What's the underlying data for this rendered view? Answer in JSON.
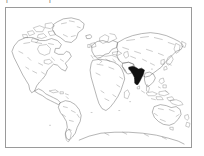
{
  "figure": {
    "type": "world-map",
    "background_color": "#ffffff",
    "frame": {
      "border_color": "#9a9a9a",
      "border_width_px": 1,
      "x": 5,
      "y": 7,
      "width": 187,
      "height": 141
    },
    "projection_note": "equirectangular world outline"
  },
  "cropped_caption": {
    "fragment_1": "|",
    "fragment_2": "|"
  },
  "legend": {
    "highlight_color": "#111111",
    "coastline_color": "#6b6b6b",
    "ocean_color": "#ffffff"
  },
  "regions": [
    {
      "name": "North America",
      "highlighted": false,
      "fill": "#ffffff"
    },
    {
      "name": "Greenland",
      "highlighted": false,
      "fill": "#ffffff"
    },
    {
      "name": "South America",
      "highlighted": false,
      "fill": "#ffffff"
    },
    {
      "name": "Europe",
      "highlighted": false,
      "fill": "#ffffff"
    },
    {
      "name": "Africa",
      "highlighted": false,
      "fill": "#ffffff"
    },
    {
      "name": "Asia",
      "highlighted": false,
      "fill": "#ffffff"
    },
    {
      "name": "India",
      "highlighted": true,
      "fill": "#111111"
    },
    {
      "name": "Sri Lanka",
      "highlighted": false,
      "fill": "#ffffff"
    },
    {
      "name": "Southeast Asia",
      "highlighted": false,
      "fill": "#ffffff"
    },
    {
      "name": "Indonesia",
      "highlighted": false,
      "fill": "#ffffff"
    },
    {
      "name": "Japan",
      "highlighted": false,
      "fill": "#ffffff"
    },
    {
      "name": "Australia",
      "highlighted": false,
      "fill": "#ffffff"
    },
    {
      "name": "New Zealand",
      "highlighted": false,
      "fill": "#ffffff"
    },
    {
      "name": "Antarctica",
      "highlighted": false,
      "fill": "#ffffff"
    },
    {
      "name": "Madagascar",
      "highlighted": false,
      "fill": "#ffffff"
    },
    {
      "name": "Iceland",
      "highlighted": false,
      "fill": "#ffffff"
    },
    {
      "name": "British Isles",
      "highlighted": false,
      "fill": "#ffffff"
    }
  ]
}
